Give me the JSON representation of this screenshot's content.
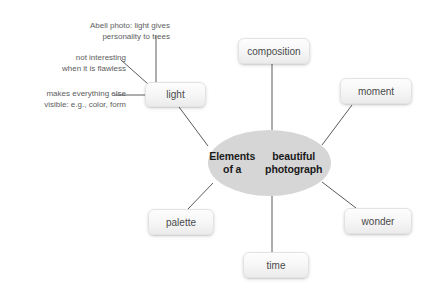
{
  "diagram": {
    "title_center": "Elements of a\nbeautiful photograph",
    "center_fill": "#d6d6d6",
    "edge_color": "#5a5a5a",
    "background": "#ffffff",
    "nodes": [
      {
        "id": "light",
        "label": "light",
        "x": 145,
        "y": 82,
        "w": 61,
        "h": 25
      },
      {
        "id": "composition",
        "label": "composition",
        "x": 238,
        "y": 38,
        "w": 72,
        "h": 26
      },
      {
        "id": "moment",
        "label": "moment",
        "x": 340,
        "y": 78,
        "w": 72,
        "h": 26
      },
      {
        "id": "wonder",
        "label": "wonder",
        "x": 344,
        "y": 208,
        "w": 68,
        "h": 26
      },
      {
        "id": "time",
        "label": "time",
        "x": 243,
        "y": 252,
        "w": 66,
        "h": 26
      },
      {
        "id": "palette",
        "label": "palette",
        "x": 148,
        "y": 209,
        "w": 66,
        "h": 26
      }
    ],
    "center": {
      "x": 208,
      "y": 130,
      "w": 123,
      "h": 66
    },
    "notes": [
      {
        "id": "abell",
        "text": "Abell photo: light gives\npersonality to trees",
        "x": 58,
        "y": 20,
        "w": 112,
        "align": "right"
      },
      {
        "id": "not-interesting",
        "text": "not interesting\nwhen it is flawless",
        "x": 22,
        "y": 52,
        "w": 104,
        "align": "right"
      },
      {
        "id": "makes-visible",
        "text": "makes everything else\nvisible: e.g., color, form",
        "x": 12,
        "y": 88,
        "w": 114,
        "align": "right"
      }
    ],
    "edges": [
      {
        "id": "center-light",
        "x1": 208,
        "y1": 146,
        "x2": 179,
        "y2": 107
      },
      {
        "id": "center-composition",
        "x1": 272,
        "y1": 130,
        "x2": 272,
        "y2": 64
      },
      {
        "id": "center-moment",
        "x1": 322,
        "y1": 145,
        "x2": 352,
        "y2": 105
      },
      {
        "id": "center-wonder",
        "x1": 322,
        "y1": 182,
        "x2": 356,
        "y2": 208
      },
      {
        "id": "center-time",
        "x1": 272,
        "y1": 196,
        "x2": 272,
        "y2": 252
      },
      {
        "id": "center-palette",
        "x1": 213,
        "y1": 183,
        "x2": 188,
        "y2": 209
      },
      {
        "id": "abell-light",
        "x1": 156,
        "y1": 36,
        "x2": 156,
        "y2": 82
      },
      {
        "id": "flaw-light",
        "x1": 121,
        "y1": 60,
        "x2": 148,
        "y2": 84
      },
      {
        "id": "visible-light",
        "x1": 114,
        "y1": 95,
        "x2": 145,
        "y2": 95
      }
    ]
  }
}
